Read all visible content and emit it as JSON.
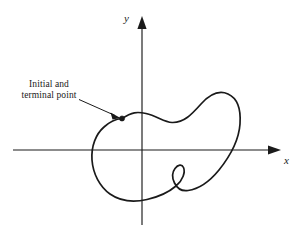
{
  "figure": {
    "type": "math-diagram",
    "background_color": "#ffffff",
    "ink_color": "#1a1a1a",
    "axes": {
      "x_label": "x",
      "y_label": "y",
      "origin": {
        "x": 142,
        "y": 150
      },
      "x_axis": {
        "start_x": 13,
        "end_x": 281,
        "y": 150,
        "arrow": "right"
      },
      "y_axis": {
        "x": 142,
        "start_y": 225,
        "end_y": 16,
        "arrow": "up"
      },
      "x_label_pos": {
        "x": 284,
        "y": 164
      },
      "y_label_pos": {
        "x": 128,
        "y": 19
      }
    },
    "annotation": {
      "line1": "Initial and",
      "line2": "terminal point",
      "leader_from": {
        "x": 80,
        "y": 100
      },
      "leader_to": {
        "x": 120,
        "y": 118
      },
      "point_marker": {
        "x": 122,
        "y": 118.5,
        "radius": 2.6
      }
    },
    "curve": {
      "closed": true,
      "has_inner_loop": true,
      "inner_loop_center": {
        "x": 174,
        "y": 176
      },
      "extents": {
        "left": 92,
        "right": 240,
        "top": 93,
        "bottom": 201
      }
    }
  }
}
